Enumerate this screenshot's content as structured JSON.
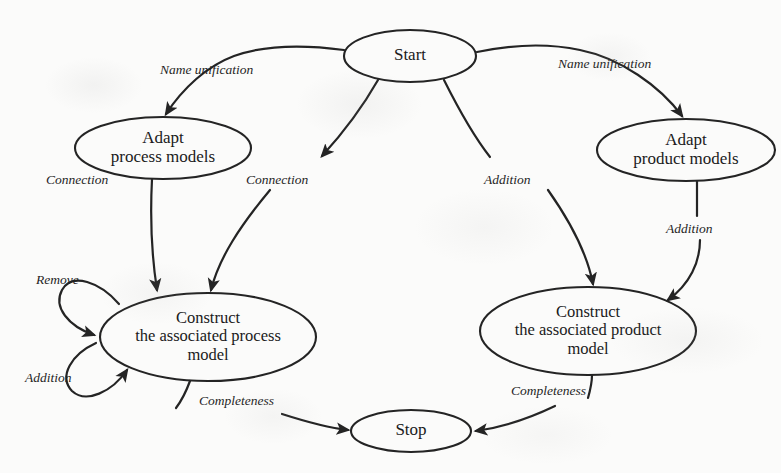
{
  "diagram": {
    "canvas": {
      "width": 781,
      "height": 473
    },
    "style": {
      "background_color": "#fbfbfa",
      "stroke_color": "#242424",
      "text_color": "#1a1a1a"
    },
    "nodes": [
      {
        "id": "start",
        "label": "Start",
        "shape": "ellipse",
        "cx": 410,
        "cy": 56,
        "rx": 66,
        "ry": 26
      },
      {
        "id": "adapt-process-models",
        "label": "Adapt\nprocess models",
        "line1": "Adapt",
        "line2": "process models",
        "shape": "ellipse",
        "cx": 163,
        "cy": 148,
        "rx": 88,
        "ry": 31
      },
      {
        "id": "adapt-product-models",
        "label": "Adapt\nproduct models",
        "line1": "Adapt",
        "line2": "product models",
        "shape": "ellipse",
        "cx": 686,
        "cy": 150,
        "rx": 89,
        "ry": 31
      },
      {
        "id": "construct-process-model",
        "label": "Construct\nthe associated process\nmodel",
        "line1": "Construct",
        "line2": "the associated process",
        "line3": "model",
        "shape": "ellipse",
        "cx": 208,
        "cy": 337,
        "rx": 108,
        "ry": 44
      },
      {
        "id": "construct-product-model",
        "label": "Construct\nthe associated product\nmodel",
        "line1": "Construct",
        "line2": "the associated product",
        "line3": "model",
        "shape": "ellipse",
        "cx": 588,
        "cy": 331,
        "rx": 108,
        "ry": 44
      },
      {
        "id": "stop",
        "label": "Stop",
        "shape": "ellipse",
        "cx": 411,
        "cy": 431,
        "rx": 60,
        "ry": 21
      }
    ],
    "edges": [
      {
        "id": "start-to-adapt-process",
        "from": "start",
        "to": "adapt-process-models",
        "label": "Name unification",
        "label_x": 160,
        "label_y": 62
      },
      {
        "id": "start-to-adapt-product",
        "from": "start",
        "to": "adapt-product-models",
        "label": "Name unification",
        "label_x": 558,
        "label_y": 56
      },
      {
        "id": "adapt-process-to-construct-process",
        "from": "adapt-process-models",
        "to": "construct-process-model",
        "label": "Connection",
        "label_x": 46,
        "label_y": 172
      },
      {
        "id": "start-to-construct-process",
        "from": "start",
        "to": "construct-process-model",
        "label": "Connection",
        "label_x": 246,
        "label_y": 172
      },
      {
        "id": "start-to-construct-product",
        "from": "start",
        "to": "construct-product-model",
        "label": "Addition",
        "label_x": 484,
        "label_y": 172
      },
      {
        "id": "adapt-product-to-construct-product",
        "from": "adapt-product-models",
        "to": "construct-product-model",
        "label": "Addition",
        "label_x": 666,
        "label_y": 221
      },
      {
        "id": "construct-process-self-remove",
        "from": "construct-process-model",
        "to": "construct-process-model",
        "label": "Remove",
        "label_x": 36,
        "label_y": 272
      },
      {
        "id": "construct-process-self-addition",
        "from": "construct-process-model",
        "to": "construct-process-model",
        "label": "Addition",
        "label_x": 25,
        "label_y": 370
      },
      {
        "id": "construct-process-to-stop",
        "from": "construct-process-model",
        "to": "stop",
        "label": "Completeness",
        "label_x": 199,
        "label_y": 393
      },
      {
        "id": "construct-product-to-stop",
        "from": "construct-product-model",
        "to": "stop",
        "label": "Completeness",
        "label_x": 511,
        "label_y": 383
      }
    ]
  }
}
